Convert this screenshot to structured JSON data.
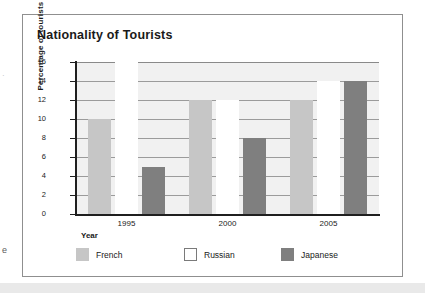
{
  "card": {
    "title": "Nationality of Tourists"
  },
  "page_margin": {
    "fragment_top": "·",
    "fragment_bottom": "e"
  },
  "chart_data": {
    "type": "bar",
    "title": "Nationality of Tourists",
    "xlabel": "Year",
    "ylabel": "Percentage of tourists",
    "categories": [
      "1995",
      "2000",
      "2005"
    ],
    "series": [
      {
        "name": "French",
        "color": "#c6c6c6",
        "values": [
          10,
          12,
          12
        ]
      },
      {
        "name": "Russian",
        "color": "#ffffff",
        "values": [
          16,
          12,
          14
        ]
      },
      {
        "name": "Japanese",
        "color": "#7f7f7f",
        "values": [
          5,
          8,
          14
        ]
      }
    ],
    "ylim": [
      0,
      16
    ],
    "ytick_step": 2,
    "yticks": [
      "16",
      "14",
      "12",
      "10",
      "8",
      "6",
      "4",
      "2",
      "0"
    ],
    "grid": true,
    "legend_position": "bottom"
  }
}
